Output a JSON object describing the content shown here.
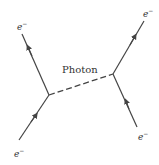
{
  "diagram": {
    "colors": {
      "line": "#444444",
      "text": "#333333",
      "background": "#ffffff"
    },
    "photon_label": "Photon",
    "particles": [
      {
        "id": "top-left",
        "label": "e",
        "charge": "−"
      },
      {
        "id": "bottom-left",
        "label": "e",
        "charge": "−"
      },
      {
        "id": "top-right",
        "label": "e",
        "charge": "−"
      },
      {
        "id": "bottom-right",
        "label": "e",
        "charge": "−"
      }
    ],
    "vertices": [
      {
        "id": "left",
        "x": 49,
        "y": 95
      },
      {
        "id": "right",
        "x": 113,
        "y": 74
      }
    ]
  }
}
